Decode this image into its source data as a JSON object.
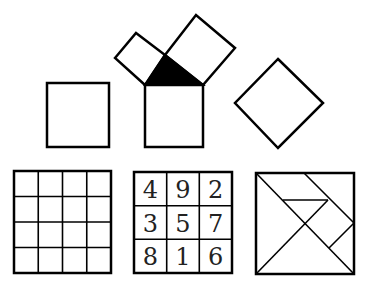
{
  "figure": {
    "top_row": {
      "left_square": {
        "points": [
          [
            47,
            83
          ],
          [
            109,
            83
          ],
          [
            109,
            147
          ],
          [
            47,
            147
          ]
        ]
      },
      "pythagoras": {
        "small_square": {
          "points": [
            [
              115,
              58
            ],
            [
              136,
              33
            ],
            [
              165,
              55
            ],
            [
              145,
              85
            ]
          ]
        },
        "large_square": {
          "points": [
            [
              165,
              55
            ],
            [
              196,
              15
            ],
            [
              235,
              48
            ],
            [
              203,
              85
            ]
          ]
        },
        "triangle": {
          "points": [
            [
              145,
              85
            ],
            [
              165,
              55
            ],
            [
              203,
              85
            ]
          ],
          "fill": "#000000"
        },
        "bottom_square": {
          "points": [
            [
              145,
              85
            ],
            [
              203,
              85
            ],
            [
              203,
              147
            ],
            [
              145,
              147
            ]
          ]
        }
      },
      "diamond": {
        "points": [
          [
            278,
            59
          ],
          [
            323,
            103
          ],
          [
            278,
            148
          ],
          [
            235,
            103
          ]
        ]
      }
    },
    "bottom_row": {
      "grid": {
        "x": 14,
        "y": 171,
        "w": 97,
        "h": 102,
        "rows": 4,
        "cols": 4
      },
      "magic_square": {
        "x": 134,
        "y": 172,
        "w": 98,
        "h": 101,
        "cells": [
          [
            "4",
            "9",
            "2"
          ],
          [
            "3",
            "5",
            "7"
          ],
          [
            "8",
            "1",
            "6"
          ]
        ]
      },
      "tangram": {
        "x": 256,
        "y": 173,
        "w": 98,
        "h": 101
      }
    }
  }
}
